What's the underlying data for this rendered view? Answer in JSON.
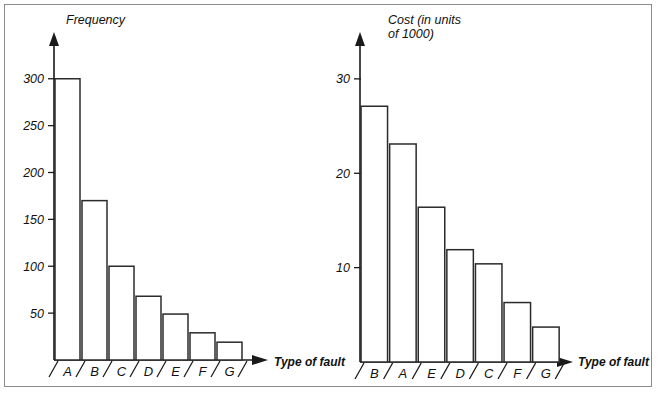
{
  "figure": {
    "background_color": "#ffffff",
    "border_color": "#8b8b8b",
    "ink_color": "#1a1a1a",
    "bar_fill_color": "#ffffff",
    "bar_stroke_color": "#2b2b2b"
  },
  "chart_data": [
    {
      "type": "bar",
      "id": "frequency-pareto",
      "title": "",
      "ylabel": "Frequency",
      "ylabel_lines": [
        "Frequency"
      ],
      "xlabel": "Type of fault",
      "categories": [
        "A",
        "B",
        "C",
        "D",
        "E",
        "F",
        "G"
      ],
      "values": [
        300,
        170,
        100,
        68,
        49,
        29,
        19
      ],
      "ylim": [
        0,
        320
      ],
      "yticks": [
        50,
        100,
        150,
        200,
        250,
        300
      ],
      "ytick_labels": [
        "50",
        "100",
        "150",
        "200",
        "250",
        "300"
      ],
      "grid": false,
      "legend": "none"
    },
    {
      "type": "bar",
      "id": "cost-pareto",
      "title": "",
      "ylabel": "Cost (in units of 1000)",
      "ylabel_lines": [
        "Cost (in units",
        "of 1000)"
      ],
      "xlabel": "Type of fault",
      "categories": [
        "B",
        "A",
        "E",
        "D",
        "C",
        "F",
        "G"
      ],
      "values": [
        27.1,
        23.1,
        16.4,
        11.9,
        10.4,
        6.3,
        3.7
      ],
      "ylim": [
        0,
        32
      ],
      "yticks": [
        10,
        20,
        30
      ],
      "ytick_labels": [
        "10",
        "20",
        "30"
      ],
      "grid": false,
      "legend": "none"
    }
  ]
}
